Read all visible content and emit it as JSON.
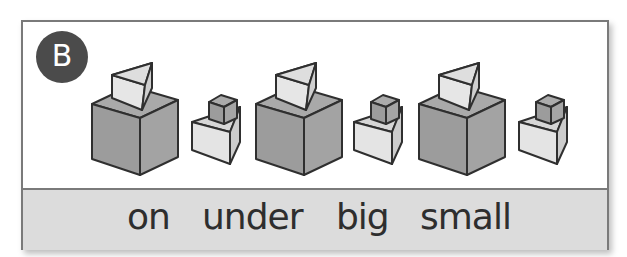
{
  "badge": {
    "label": "B",
    "color": "#4b4b4b"
  },
  "scene": {
    "description": "Three pairs of shapes: a big cube with a wedge on it, and a small wedge with a small cube on it",
    "groups": [
      {
        "big": "big cube with wedge on top",
        "small": "small wedge with small cube on top"
      },
      {
        "big": "big cube with wedge on top",
        "small": "small wedge with small cube on top"
      },
      {
        "big": "big cube with wedge on top",
        "small": "small wedge with small cube on top"
      }
    ],
    "colors": {
      "dark_face": "#9c9c9c",
      "mid_face": "#b3b3b3",
      "light_face": "#e4e4e4",
      "outline": "#2f2f2f"
    }
  },
  "words": [
    "on",
    "under",
    "big",
    "small"
  ],
  "strip_color": "#dcdcdc"
}
